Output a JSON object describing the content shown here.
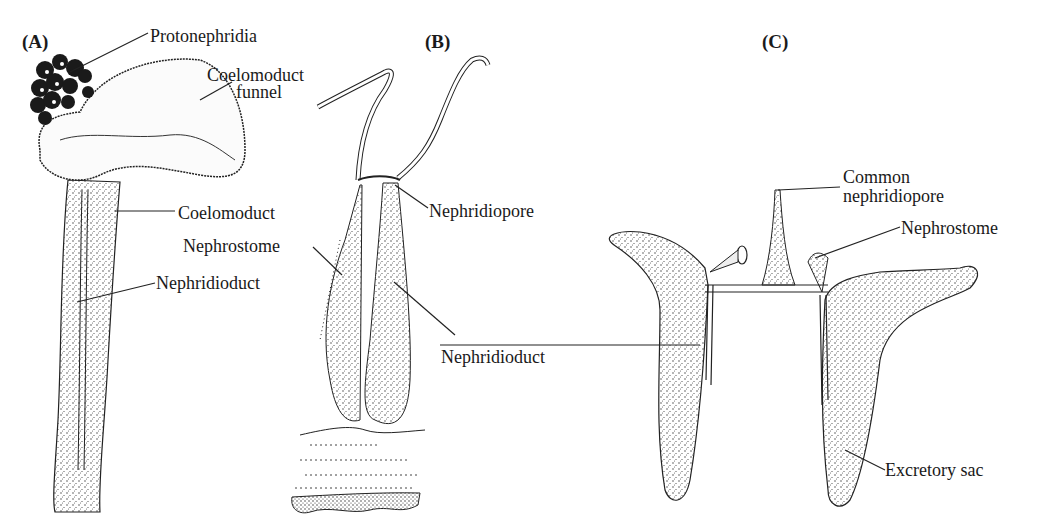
{
  "figure": {
    "panels": [
      {
        "id": "A",
        "letter": "(A)",
        "labels": {
          "protonephridia": "Protonephridia",
          "coelomoduct_funnel_1": "Coelomoduct",
          "coelomoduct_funnel_2": "funnel",
          "coelomoduct": "Coelomoduct",
          "nephridioduct": "Nephridioduct"
        }
      },
      {
        "id": "B",
        "letter": "(B)",
        "labels": {
          "nephridiopore": "Nephridiopore",
          "nephrostome": "Nephrostome",
          "nephridioduct": "Nephridioduct"
        }
      },
      {
        "id": "C",
        "letter": "(C)",
        "labels": {
          "common_nephridiopore_1": "Common",
          "common_nephridiopore_2": "nephridiopore",
          "nephrostome": "Nephrostome",
          "excretory_sac": "Excretory sac"
        }
      }
    ]
  }
}
